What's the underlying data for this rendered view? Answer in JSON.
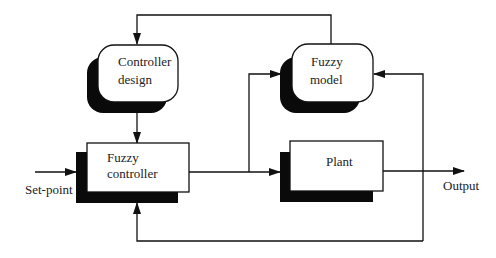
{
  "diagram": {
    "type": "block-diagram",
    "blocks": [
      {
        "id": "controller_design",
        "lines": [
          "Controller",
          "design"
        ],
        "shape": "rounded-rect"
      },
      {
        "id": "fuzzy_model",
        "lines": [
          "Fuzzy",
          "model"
        ],
        "shape": "rounded-rect"
      },
      {
        "id": "fuzzy_controller",
        "lines": [
          "Fuzzy",
          "controller"
        ],
        "shape": "rect"
      },
      {
        "id": "plant",
        "lines": [
          "Plant"
        ],
        "shape": "rect"
      }
    ],
    "labels": {
      "input": "Set-point",
      "output": "Output"
    },
    "edges": [
      {
        "from": "Set-point",
        "to": "fuzzy_controller"
      },
      {
        "from": "fuzzy_controller",
        "to": "plant"
      },
      {
        "from": "fuzzy_controller",
        "to": "fuzzy_model"
      },
      {
        "from": "plant",
        "to": "Output"
      },
      {
        "from": "plant",
        "to": "fuzzy_model",
        "note": "output feedback"
      },
      {
        "from": "plant",
        "to": "fuzzy_controller",
        "note": "output feedback"
      },
      {
        "from": "fuzzy_model",
        "to": "controller_design"
      },
      {
        "from": "controller_design",
        "to": "fuzzy_controller"
      }
    ],
    "colors": {
      "line": "#111111",
      "shadow": "#0a0a0a",
      "box": "#ffffff"
    }
  }
}
